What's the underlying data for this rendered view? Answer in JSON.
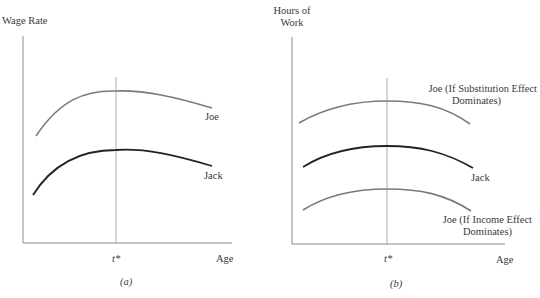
{
  "panel_a": {
    "y_axis_label": "Wage Rate",
    "x_axis_label": "Age",
    "marker_label": "t*",
    "caption": "(a)",
    "curves": {
      "joe": {
        "label": "Joe",
        "color": "#7a7a7a"
      },
      "jack": {
        "label": "Jack",
        "color": "#222222"
      }
    }
  },
  "panel_b": {
    "y_axis_label_line1": "Hours of",
    "y_axis_label_line2": "Work",
    "x_axis_label": "Age",
    "marker_label": "t*",
    "caption": "(b)",
    "curves": {
      "joe_substitution": {
        "label_line1": "Joe (If Substitution Effect",
        "label_line2": "Dominates)",
        "color": "#7a7a7a"
      },
      "jack": {
        "label": "Jack",
        "color": "#222222"
      },
      "joe_income": {
        "label_line1": "Joe (If Income Effect",
        "label_line2": "Dominates)",
        "color": "#7a7a7a"
      }
    }
  },
  "colors": {
    "axis": "#8a8a8a",
    "marker_line": "#9a9a9a",
    "text": "#3a3a3a"
  }
}
